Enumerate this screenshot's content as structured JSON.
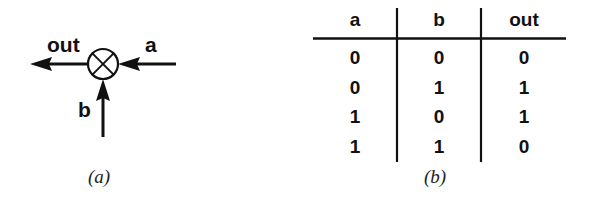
{
  "diagram": {
    "symbol": "xor-circle",
    "labels": {
      "out": "out",
      "a": "a",
      "b": "b"
    },
    "caption": "(a)"
  },
  "table": {
    "headers": [
      "a",
      "b",
      "out"
    ],
    "rows": [
      [
        "0",
        "0",
        "0"
      ],
      [
        "0",
        "1",
        "1"
      ],
      [
        "1",
        "0",
        "1"
      ],
      [
        "1",
        "1",
        "0"
      ]
    ],
    "caption": "(b)"
  }
}
